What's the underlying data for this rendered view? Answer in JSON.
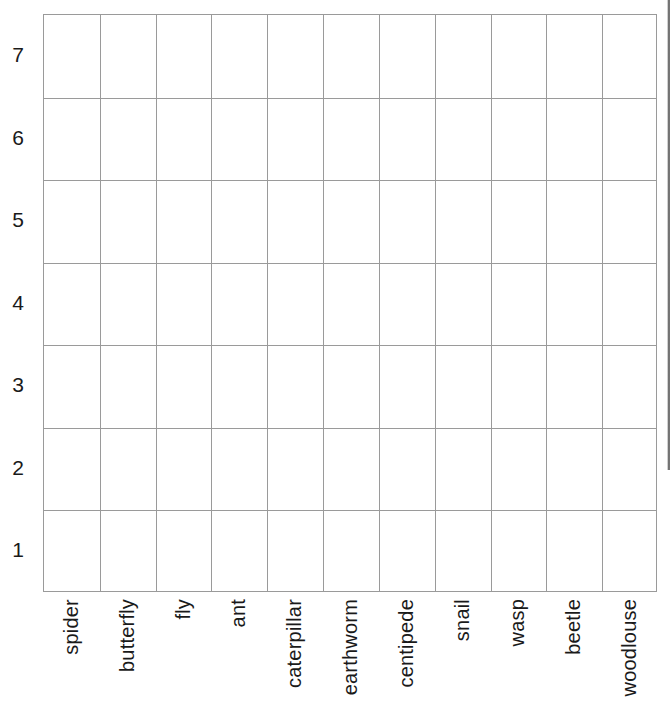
{
  "chart_data": {
    "type": "bar",
    "title": "",
    "subtitle": "",
    "xlabel": "",
    "ylabel": "",
    "categories": [
      "spider",
      "butterfly",
      "fly",
      "ant",
      "caterpillar",
      "earthworm",
      "centipede",
      "snail",
      "wasp",
      "beetle",
      "woodlouse"
    ],
    "values": [
      0,
      0,
      0,
      0,
      0,
      0,
      0,
      0,
      0,
      0,
      0
    ],
    "y_ticks": [
      1,
      2,
      3,
      4,
      5,
      6,
      7
    ],
    "y_tick_labels": [
      "7",
      "6",
      "5",
      "4",
      "3",
      "2",
      "1"
    ],
    "ylim": [
      0,
      7
    ],
    "grid": true,
    "legend": "none",
    "colors": {
      "grid_line": "#9a9a9a",
      "border": "#9a9a9a",
      "text": "#1a1a1a",
      "background": "#ffffff"
    }
  },
  "axes": {
    "y_axis": {
      "name": "count-axis",
      "labels": [
        "7",
        "6",
        "5",
        "4",
        "3",
        "2",
        "1"
      ]
    },
    "x_axis": {
      "name": "minibeast-axis",
      "labels": [
        "spider",
        "butterfly",
        "fly",
        "ant",
        "caterpillar",
        "earthworm",
        "centipede",
        "snail",
        "wasp",
        "beetle",
        "woodlouse"
      ]
    }
  }
}
